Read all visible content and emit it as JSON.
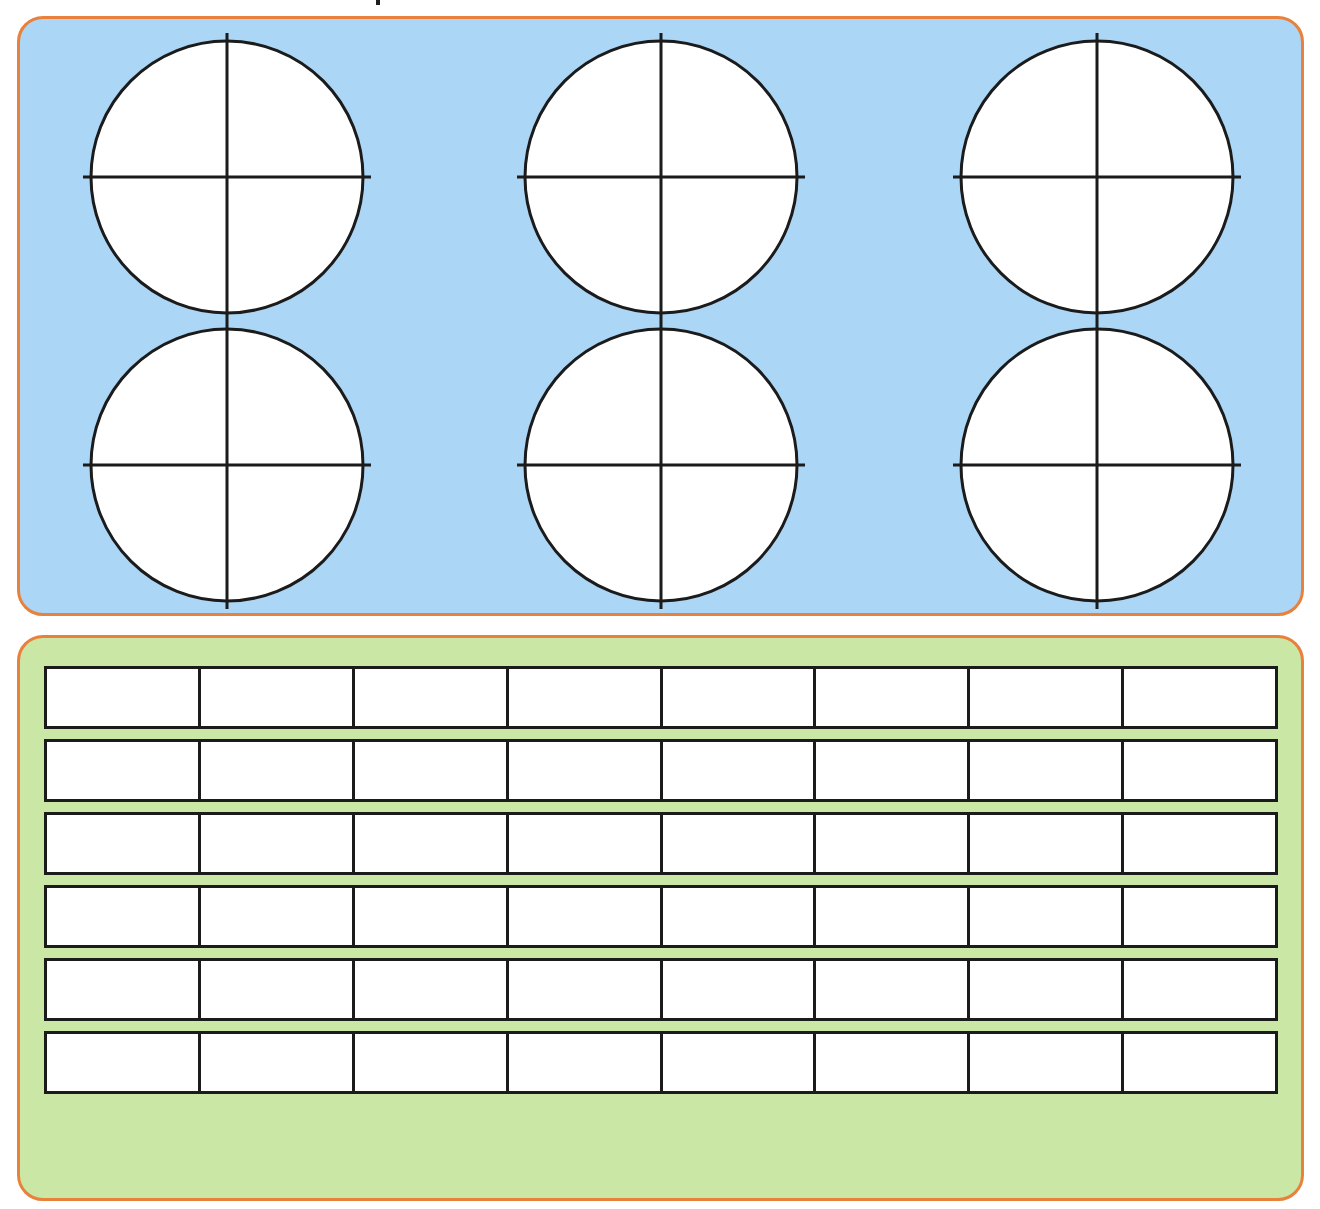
{
  "page": {
    "width": 1320,
    "height": 1209,
    "background": "#FFFFFF",
    "heading_fragment_note": "partial descender of cropped title above top edge"
  },
  "colors": {
    "panel_border": "#E8813C",
    "circles_panel_fill": "#ACD6F5",
    "rects_panel_fill": "#CBE7A5",
    "shape_stroke": "#1B1B1B",
    "shape_fill": "#FFFFFF"
  },
  "circles_panel": {
    "name": "circle-fraction-models",
    "fill": "#ACD6F5",
    "rows": 2,
    "columns": 3,
    "total_circles": 6,
    "divisions_per_circle": 4,
    "division_type": "quarters",
    "circles": [
      {
        "label": "circle-1",
        "row": 1,
        "column": 1,
        "cx": 224,
        "cy": 174,
        "r": 136,
        "parts": 4,
        "shaded": 0
      },
      {
        "label": "circle-2",
        "row": 1,
        "column": 2,
        "cx": 658,
        "cy": 174,
        "r": 136,
        "parts": 4,
        "shaded": 0
      },
      {
        "label": "circle-3",
        "row": 1,
        "column": 3,
        "cx": 1094,
        "cy": 174,
        "r": 136,
        "parts": 4,
        "shaded": 0
      },
      {
        "label": "circle-4",
        "row": 2,
        "column": 1,
        "cx": 224,
        "cy": 462,
        "r": 136,
        "parts": 4,
        "shaded": 0
      },
      {
        "label": "circle-5",
        "row": 2,
        "column": 2,
        "cx": 658,
        "cy": 462,
        "r": 136,
        "parts": 4,
        "shaded": 0
      },
      {
        "label": "circle-6",
        "row": 2,
        "column": 3,
        "cx": 1094,
        "cy": 462,
        "r": 136,
        "parts": 4,
        "shaded": 0
      }
    ]
  },
  "rects_panel": {
    "name": "rectangle-fraction-strips",
    "fill": "#CBE7A5",
    "strip_count": 6,
    "cells_per_strip": 8,
    "strips": [
      {
        "label": "strip-1",
        "cells": 8,
        "shaded": 0
      },
      {
        "label": "strip-2",
        "cells": 8,
        "shaded": 0
      },
      {
        "label": "strip-3",
        "cells": 8,
        "shaded": 0
      },
      {
        "label": "strip-4",
        "cells": 8,
        "shaded": 0
      },
      {
        "label": "strip-5",
        "cells": 8,
        "shaded": 0
      },
      {
        "label": "strip-6",
        "cells": 8,
        "shaded": 0
      }
    ]
  }
}
